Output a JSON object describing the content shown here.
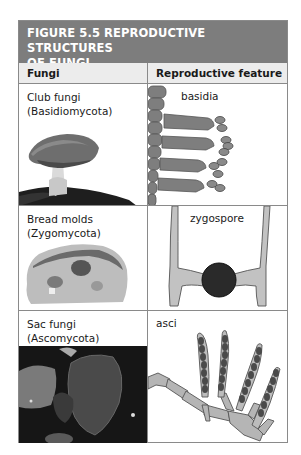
{
  "figure": {
    "title_line1": "FIGURE 5.5  REPRODUCTIVE STRUCTURES",
    "title_line2": "OF FUNGI",
    "header_color": "#7d7d7d",
    "column_headers": [
      "Fungi",
      "Reproductive feature"
    ]
  },
  "rows": [
    {
      "fungi_line1": "Club fungi",
      "fungi_line2": "(Basidiomycota)",
      "image": "mushroom-photo",
      "feature_label": "basidia",
      "feature_diagram": "basidia-diagram"
    },
    {
      "fungi_line1": "Bread molds",
      "fungi_line2": "(Zygomycota)",
      "image": "moldy-bread-photo",
      "feature_label": "zygospore",
      "feature_diagram": "zygospore-diagram"
    },
    {
      "fungi_line1": "Sac fungi",
      "fungi_line2": "(Ascomycota)",
      "image": "cup-fungi-photo",
      "feature_label": "asci",
      "feature_diagram": "asci-diagram"
    }
  ]
}
